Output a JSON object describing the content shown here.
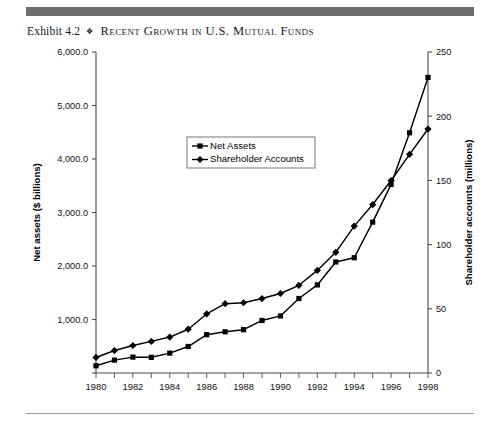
{
  "exhibit": {
    "number": "Exhibit 4.2",
    "separator": "❖",
    "title": "Recent Growth in U.S. Mutual Funds"
  },
  "chart_data": {
    "type": "line",
    "title": "Recent Growth in U.S. Mutual Funds",
    "xlabel": "",
    "ylabel": "Net assets ($ billions)",
    "y2label": "Shareholder accounts (millions)",
    "x": [
      1980,
      1981,
      1982,
      1983,
      1984,
      1985,
      1986,
      1987,
      1988,
      1989,
      1990,
      1991,
      1992,
      1993,
      1994,
      1995,
      1996,
      1997,
      1998
    ],
    "xtick_labels": [
      "1980",
      "",
      "1982",
      "",
      "1984",
      "",
      "1986",
      "",
      "1988",
      "",
      "1990",
      "",
      "1992",
      "",
      "1994",
      "",
      "1996",
      "",
      "1998"
    ],
    "xlim": [
      1980,
      1998
    ],
    "ylim": [
      0,
      6000
    ],
    "ytick_labels": [
      "",
      "1,000.0",
      "2,000.0",
      "3,000.0",
      "4,000.0",
      "5,000.0",
      "6,000.0"
    ],
    "yticks": [
      0,
      1000,
      2000,
      3000,
      4000,
      5000,
      6000
    ],
    "y2lim": [
      0,
      250
    ],
    "y2ticks": [
      0,
      50,
      100,
      150,
      200,
      250
    ],
    "y2tick_labels": [
      "0",
      "50",
      "100",
      "150",
      "200",
      "250"
    ],
    "grid": false,
    "legend_position": "upper center",
    "series": [
      {
        "name": "Net Assets",
        "axis": "left",
        "marker": "square",
        "values": [
          135,
          241,
          297,
          293,
          371,
          495,
          716,
          770,
          810,
          982,
          1067,
          1393,
          1646,
          2075,
          2155,
          2820,
          3526,
          4490,
          5525
        ]
      },
      {
        "name": "Shareholder Accounts",
        "axis": "right",
        "marker": "diamond",
        "values": [
          12.1,
          17.5,
          21.4,
          24.6,
          28.0,
          34.1,
          46.0,
          54.0,
          54.7,
          58.0,
          61.9,
          68.3,
          79.9,
          94.0,
          114.4,
          131.2,
          149.9,
          170.3,
          190.0
        ]
      }
    ]
  },
  "legend": {
    "items": [
      {
        "label": "Net Assets",
        "marker": "square"
      },
      {
        "label": "Shareholder Accounts",
        "marker": "diamond"
      }
    ]
  }
}
